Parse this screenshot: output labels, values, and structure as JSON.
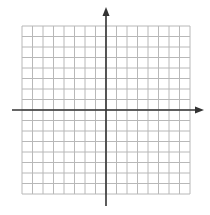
{
  "diagram": {
    "type": "coordinate-grid",
    "grid": {
      "cells_x": 16,
      "cells_y": 16,
      "cell_size": 10.5,
      "left": 22,
      "top": 26,
      "line_color": "#b8b8b8"
    },
    "axes": {
      "origin_x": 106,
      "origin_y": 110,
      "color": "#333333",
      "x_start": 12,
      "x_end": 204,
      "y_start": 7,
      "y_end": 206
    }
  }
}
